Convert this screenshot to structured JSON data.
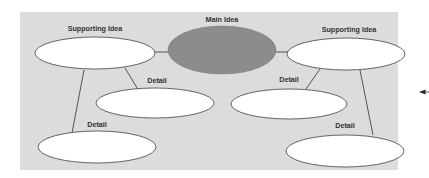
{
  "diagram": {
    "type": "main-idea web / graphic organizer",
    "colors": {
      "panel": "#dcdcdc",
      "main_oval": "#8c8c8c",
      "detail_oval": "#ffffff",
      "outline": "#555555",
      "label": "#333333"
    },
    "main_idea": {
      "label": "Main Idea"
    },
    "supporting_ideas": [
      {
        "label": "Supporting Idea"
      },
      {
        "label": "Supporting Idea"
      }
    ],
    "details": [
      {
        "label": "Detail"
      },
      {
        "label": "Detail"
      },
      {
        "label": "Detail"
      },
      {
        "label": "Detail"
      }
    ],
    "pointer": {
      "icon": "arrow-left-icon"
    }
  }
}
